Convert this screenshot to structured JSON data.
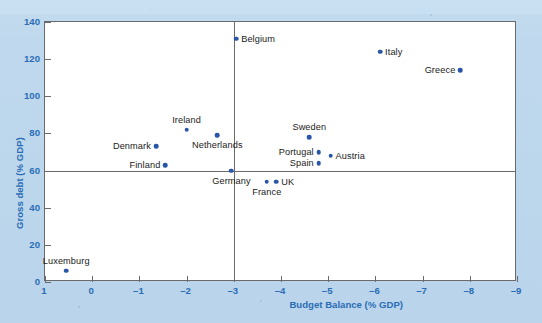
{
  "chart_data": {
    "type": "scatter",
    "title": "",
    "xlabel": "Budget Balance (% GDP)",
    "ylabel": "Gross debt (% GDP)",
    "xlim": [
      1,
      -9
    ],
    "ylim": [
      0,
      140
    ],
    "xticks": [
      1,
      0,
      -1,
      -2,
      -3,
      -4,
      -5,
      -6,
      -7,
      -8,
      -9
    ],
    "xticklabels": [
      "1",
      "0",
      "–1",
      "–2",
      "–3",
      "–4",
      "–5",
      "–6",
      "–7",
      "–8",
      "–9"
    ],
    "yticks": [
      0,
      20,
      40,
      60,
      80,
      100,
      120,
      140
    ],
    "yticklabels": [
      "0",
      "20",
      "40",
      "60",
      "80",
      "100",
      "120",
      "140"
    ],
    "grid": false,
    "legend": "none",
    "reference_lines": [
      {
        "orientation": "horizontal",
        "value": 60,
        "label": "Maastricht debt criterion 60% of GDP"
      },
      {
        "orientation": "vertical",
        "value": -3,
        "label": "Maastricht deficit criterion 3% of GDP"
      }
    ],
    "point_color": "#2a56a8",
    "points": [
      {
        "name": "Belgium",
        "x": -3.05,
        "y": 131,
        "label_side": "right"
      },
      {
        "name": "Italy",
        "x": -6.1,
        "y": 124,
        "label_side": "right"
      },
      {
        "name": "Greece",
        "x": -7.8,
        "y": 114,
        "label_side": "left"
      },
      {
        "name": "Ireland",
        "x": -2.0,
        "y": 82,
        "label_side": "above"
      },
      {
        "name": "Netherlands",
        "x": -2.65,
        "y": 79,
        "label_side": "below"
      },
      {
        "name": "Denmark",
        "x": -1.35,
        "y": 73,
        "label_side": "left"
      },
      {
        "name": "Sweden",
        "x": -4.6,
        "y": 78,
        "label_side": "above"
      },
      {
        "name": "Portugal",
        "x": -4.8,
        "y": 70,
        "label_side": "left"
      },
      {
        "name": "Austria",
        "x": -5.05,
        "y": 68,
        "label_side": "right"
      },
      {
        "name": "Spain",
        "x": -4.8,
        "y": 64,
        "label_side": "left"
      },
      {
        "name": "Finland",
        "x": -1.55,
        "y": 63,
        "label_side": "left"
      },
      {
        "name": "Germany",
        "x": -2.95,
        "y": 60,
        "label_side": "below"
      },
      {
        "name": "France",
        "x": -3.7,
        "y": 54,
        "label_side": "below"
      },
      {
        "name": "UK",
        "x": -3.9,
        "y": 54,
        "label_side": "right"
      },
      {
        "name": "Luxemburg",
        "x": 0.55,
        "y": 6,
        "label_side": "above"
      }
    ]
  },
  "caption": "",
  "axis_color": "#2a6db5"
}
